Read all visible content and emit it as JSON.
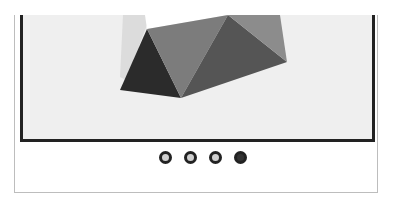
{
  "carousel": {
    "slide_count": 4,
    "active_index": 3,
    "dots": [
      {
        "label": "slide-1",
        "active": false
      },
      {
        "label": "slide-2",
        "active": false
      },
      {
        "label": "slide-3",
        "active": false
      },
      {
        "label": "slide-4",
        "active": true
      }
    ],
    "image": {
      "description": "low-poly gray geometric shape",
      "colors": {
        "background": "#efefef",
        "left_face": "#2b2b2b",
        "middle_face": "#7c7c7c",
        "lower_right_face": "#555555",
        "upper_right_face": "#8c8c8c",
        "ghost": "#dcdcdc",
        "top_gap": "#ffffff"
      }
    }
  }
}
